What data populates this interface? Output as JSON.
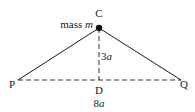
{
  "diagram": {
    "points": {
      "C": {
        "label": "C"
      },
      "P": {
        "label": "P"
      },
      "Q": {
        "label": "Q"
      },
      "D": {
        "label": "D"
      }
    },
    "mass_label": {
      "prefix": "mass ",
      "symbol": "m"
    },
    "height_label": {
      "number": "3",
      "symbol": "a"
    },
    "base_label": {
      "number": "8",
      "symbol": "a"
    },
    "colors": {
      "line": "#1a1a1a",
      "background": "#ffffff"
    }
  }
}
